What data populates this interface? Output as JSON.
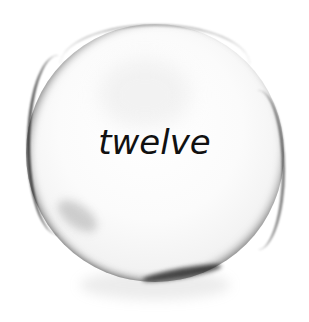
{
  "image": {
    "subject": "glass-sphere",
    "label": "twelve",
    "colors": {
      "background": "#ffffff",
      "text": "#111111",
      "rim": "#1a1a1a"
    }
  }
}
